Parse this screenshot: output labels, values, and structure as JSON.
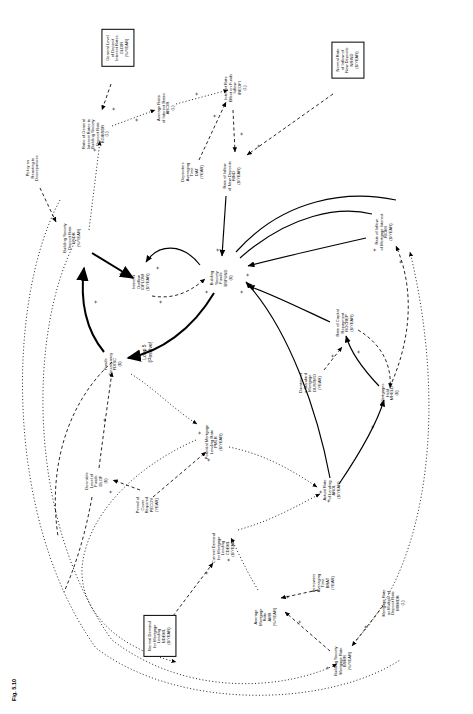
{
  "figure": {
    "caption": "Fig. 5.10",
    "orientation_degrees": -90,
    "type": "causal-loop-diagram"
  },
  "loops": [
    {
      "id": "loop-5",
      "label": "Loop 5\n(Positive)"
    }
  ],
  "policy_labels": [
    {
      "id": "policy-reacting-discrepancies",
      "label": "Policy on\nReacting to\nDiscrepancies"
    }
  ],
  "nodes": [
    {
      "id": "gldir",
      "boxed": true,
      "label": "General Level\nof Deposit\nInterest Rates\nGLDIR\n(%/YEAR)"
    },
    {
      "id": "nrind",
      "boxed": true,
      "label": "Normal Rate\nof Inflow of\nNew Deposits\nNRIND\n($/YEAR)"
    },
    {
      "id": "ndeml",
      "boxed": true,
      "label": "Normal Demand\nfor Mortgage\nLending\nNDEML\n($/YEAR)"
    },
    {
      "id": "rgibsdr",
      "boxed": false,
      "label": "Ratio of General\nInterest Rates to\nBuilding Society\nDeposit Rate\nRGIBSDR\n(1)"
    },
    {
      "id": "arloir",
      "boxed": false,
      "label": "Average Ratio\nof Interest Rates\nARCIR\n(1)"
    },
    {
      "id": "ireofi",
      "boxed": false,
      "label": "Interest Rate\nEffect on Funds\nInflow\nIREOFI\n(1)"
    },
    {
      "id": "dat",
      "boxed": false,
      "label": "Depositors\nAveraging\nTime\nDAT\n(YEAR)"
    },
    {
      "id": "rind",
      "boxed": false,
      "label": "Rate of Inflow\nof New Deposits\nRIND\n($/YEAR)"
    },
    {
      "id": "bsdr",
      "boxed": false,
      "label": "Building Society\nDeposit Rate\nBSDR\n(%/YEAR)"
    },
    {
      "id": "ioflow",
      "boxed": false,
      "label": "Interest\nOutflow\nIOFLOW\n($/YEAR)"
    },
    {
      "id": "bsfund",
      "boxed": false,
      "label": "Building\nSociety\nFunds\nBSFUND\n($)"
    },
    {
      "id": "riomi",
      "boxed": false,
      "label": "Rate of Inflow\nof Mortgage Interest\nRIOMI\n($/YEAR)"
    },
    {
      "id": "rocrep",
      "boxed": false,
      "label": "Rate of Capital\nRepayment\nROCREP\n($/YEAR)"
    },
    {
      "id": "dustmo",
      "boxed": false,
      "label": "Duration of\na Standard\nMortgage\nDUSTMO\n(YEAR)"
    },
    {
      "id": "mheld",
      "boxed": false,
      "label": "Mortgages\nHeld\nMHELD\n($)"
    },
    {
      "id": "fdisc",
      "boxed": false,
      "label": "Funds\nDiscrepancy\nFDISC\n($)"
    },
    {
      "id": "dlof",
      "boxed": false,
      "label": "Desirable\nLevel of\nFunds\nDLOF\n($)"
    },
    {
      "id": "pecov",
      "boxed": false,
      "label": "Period of\nCover\nRequired\nPECOV\n(YEAR)"
    },
    {
      "id": "pmlr",
      "boxed": false,
      "label": "Potential Mortgage\nLending Rate\nPMLR\n($/YEAR)"
    },
    {
      "id": "arol",
      "boxed": false,
      "label": "Actual Rate\nof Lending\nAROL\n($/YEAR)"
    },
    {
      "id": "cdeml",
      "boxed": false,
      "label": "Current Demand\nfor Mortgage\nLending\nCDEML\n($/YEAR)"
    },
    {
      "id": "amr",
      "boxed": false,
      "label": "Average\nMortgage\nRate\nAMR\n(%/YEAR)"
    },
    {
      "id": "brat",
      "boxed": false,
      "label": "Borrowers\nAveraging\nTime\nBRAT\n(YEAR)"
    },
    {
      "id": "mrmdr",
      "boxed": false,
      "label": "Mortgage Rate\nas Multiple of\nDeposit Rate\nMRMDR\n(1)"
    },
    {
      "id": "bsmr",
      "boxed": false,
      "label": "Building Society\nMortgage Rate\nBSMR\n(%/YEAR)"
    }
  ],
  "link_signs": [
    "+",
    "+",
    "+",
    "+",
    "+",
    "+",
    "+",
    "+",
    "+",
    "+",
    "+",
    "+",
    "+",
    "+",
    "+",
    "+",
    "+",
    "+",
    "+",
    "+",
    "+",
    "+",
    "+",
    "+",
    "+",
    "+",
    "+",
    "+",
    "+",
    "+",
    "+",
    "+"
  ],
  "colors": {
    "ink": "#000000",
    "paper": "#ffffff"
  }
}
